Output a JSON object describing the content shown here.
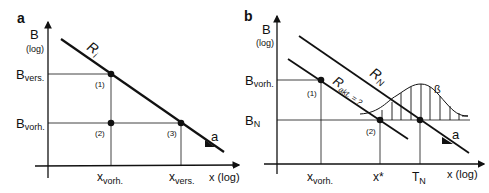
{
  "panel_a": {
    "label": "a",
    "y_axis": {
      "name": "B",
      "scale": "(log)"
    },
    "x_axis": {
      "label": "x (log)"
    },
    "line_label": {
      "base": "R",
      "sub": "i"
    },
    "y_ticks": [
      {
        "base": "B",
        "sub": "vers."
      },
      {
        "base": "B",
        "sub": "vorh."
      }
    ],
    "x_ticks": [
      {
        "base": "x",
        "sub": "vorh."
      },
      {
        "base": "x",
        "sub": "vers."
      }
    ],
    "points": [
      "(1)",
      "(2)",
      "(3)"
    ],
    "slope_label": "a"
  },
  "panel_b": {
    "label": "b",
    "y_axis": {
      "name": "B",
      "scale": "(log)"
    },
    "x_axis": {
      "label": "x (log)"
    },
    "line_labels": [
      {
        "base": "R",
        "sub": "N"
      },
      {
        "base": "R",
        "sub": "akt. = ?"
      }
    ],
    "y_ticks": [
      {
        "base": "B",
        "sub": "vorh."
      },
      {
        "base": "B",
        "sub": "N"
      }
    ],
    "x_ticks": [
      {
        "base": "x",
        "sub": "vorh."
      },
      {
        "base": "x*",
        "sub": ""
      },
      {
        "base": "T",
        "sub": "N"
      }
    ],
    "points": [
      "(1)",
      "(2)"
    ],
    "distribution_label": "ß",
    "slope_label": "a"
  }
}
